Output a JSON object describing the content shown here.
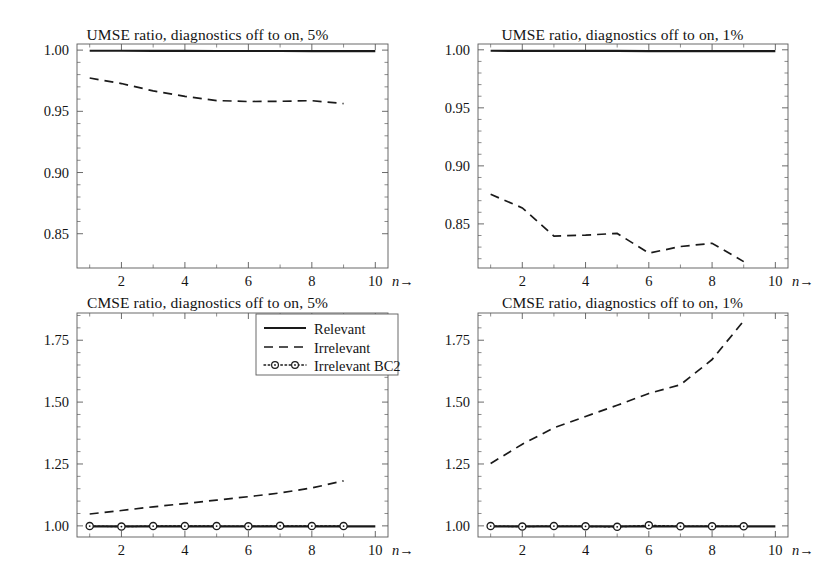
{
  "figure": {
    "background": "#ffffff",
    "axis_color": "#5a5a5a",
    "line_color": "#1a1a1a",
    "panel_count": 4
  },
  "legend": {
    "position": "bottom-left-panel-top-right",
    "entries": [
      {
        "label": "Relevant",
        "style": "solid"
      },
      {
        "label": "Irrelevant",
        "style": "dashed"
      },
      {
        "label": "Irrelevant BC2",
        "style": "dotted-circles"
      }
    ]
  },
  "axis": {
    "x_arrow_label_prefix": "10",
    "x_arrow_label_var": "n",
    "x_arrow_glyph": "→"
  },
  "chart_data": [
    {
      "id": "umse-5pct",
      "type": "line",
      "title": "UMSE ratio, diagnostics off to on, 5%",
      "xlabel": "n",
      "ylabel": "",
      "xlim": [
        0.6,
        10.4
      ],
      "ylim": [
        0.822,
        1.005
      ],
      "xticks": [
        2,
        4,
        6,
        8,
        10
      ],
      "xticklabels": [
        "2",
        "4",
        "6",
        "8",
        "10"
      ],
      "xminorticks": [
        1,
        3,
        5,
        7,
        9
      ],
      "yticks": [
        0.85,
        0.9,
        0.95,
        1.0
      ],
      "yticklabels": [
        "0.85",
        "0.90",
        "0.95",
        "1.00"
      ],
      "yminorticks": [
        0.86,
        0.87,
        0.88,
        0.89,
        0.91,
        0.92,
        0.93,
        0.94,
        0.96,
        0.97,
        0.98,
        0.99
      ],
      "grid": false,
      "x": [
        1,
        2,
        3,
        4,
        5,
        6,
        7,
        8,
        9,
        10
      ],
      "series": [
        {
          "name": "Relevant",
          "style": "solid",
          "x": [
            1,
            2,
            3,
            4,
            5,
            6,
            7,
            8,
            9,
            10
          ],
          "values": [
            0.9995,
            0.9995,
            0.9994,
            0.9994,
            0.9993,
            0.9993,
            0.9993,
            0.9992,
            0.9992,
            0.9992
          ]
        },
        {
          "name": "Irrelevant",
          "style": "dashed",
          "x": [
            1,
            2,
            3,
            4,
            5,
            6,
            7,
            8,
            9
          ],
          "values": [
            0.9772,
            0.9727,
            0.9667,
            0.9622,
            0.9588,
            0.958,
            0.9582,
            0.9587,
            0.9563
          ]
        }
      ]
    },
    {
      "id": "umse-1pct",
      "type": "line",
      "title": "UMSE ratio, diagnostics off to on, 1%",
      "xlabel": "n",
      "ylabel": "",
      "xlim": [
        0.6,
        10.4
      ],
      "ylim": [
        0.812,
        1.005
      ],
      "xticks": [
        2,
        4,
        6,
        8,
        10
      ],
      "xticklabels": [
        "2",
        "4",
        "6",
        "8",
        "10"
      ],
      "xminorticks": [
        1,
        3,
        5,
        7,
        9
      ],
      "yticks": [
        0.85,
        0.9,
        0.95,
        1.0
      ],
      "yticklabels": [
        "0.85",
        "0.90",
        "0.95",
        "1.00"
      ],
      "yminorticks": [
        0.82,
        0.83,
        0.84,
        0.86,
        0.87,
        0.88,
        0.89,
        0.91,
        0.92,
        0.93,
        0.94,
        0.96,
        0.97,
        0.98,
        0.99
      ],
      "grid": false,
      "x": [
        1,
        2,
        3,
        4,
        5,
        6,
        7,
        8,
        9,
        10
      ],
      "series": [
        {
          "name": "Relevant",
          "style": "solid",
          "x": [
            1,
            2,
            3,
            4,
            5,
            6,
            7,
            8,
            9,
            10
          ],
          "values": [
            0.9992,
            0.9991,
            0.9991,
            0.999,
            0.999,
            0.9989,
            0.9989,
            0.9989,
            0.9988,
            0.9988
          ]
        },
        {
          "name": "Irrelevant",
          "style": "dashed",
          "x": [
            1,
            2,
            3,
            4,
            5,
            6,
            7,
            8,
            9
          ],
          "values": [
            0.8755,
            0.8638,
            0.8395,
            0.8403,
            0.8418,
            0.8248,
            0.8305,
            0.8333,
            0.8175
          ]
        }
      ]
    },
    {
      "id": "cmse-5pct",
      "type": "line",
      "title": "CMSE ratio, diagnostics off to on, 5%",
      "xlabel": "n",
      "ylabel": "",
      "xlim": [
        0.6,
        10.4
      ],
      "ylim": [
        0.955,
        1.86
      ],
      "xticks": [
        2,
        4,
        6,
        8,
        10
      ],
      "xticklabels": [
        "2",
        "4",
        "6",
        "8",
        "10"
      ],
      "xminorticks": [
        1,
        3,
        5,
        7,
        9
      ],
      "yticks": [
        1.0,
        1.25,
        1.5,
        1.75
      ],
      "yticklabels": [
        "1.00",
        "1.25",
        "1.50",
        "1.75"
      ],
      "yminorticks": [
        1.05,
        1.1,
        1.15,
        1.2,
        1.3,
        1.35,
        1.4,
        1.45,
        1.55,
        1.6,
        1.65,
        1.7,
        1.8,
        1.85
      ],
      "grid": false,
      "has_legend": true,
      "x": [
        1,
        2,
        3,
        4,
        5,
        6,
        7,
        8,
        9,
        10
      ],
      "series": [
        {
          "name": "Relevant",
          "style": "solid",
          "x": [
            1,
            2,
            3,
            4,
            5,
            6,
            7,
            8,
            9,
            10
          ],
          "values": [
            0.998,
            0.998,
            0.998,
            0.998,
            0.998,
            0.998,
            0.998,
            0.998,
            0.998,
            0.998
          ]
        },
        {
          "name": "Irrelevant",
          "style": "dashed",
          "x": [
            1,
            2,
            3,
            4,
            5,
            6,
            7,
            8,
            9
          ],
          "values": [
            1.048,
            1.062,
            1.077,
            1.09,
            1.104,
            1.118,
            1.133,
            1.153,
            1.182
          ]
        },
        {
          "name": "Irrelevant BC2",
          "style": "dotted-circles",
          "x": [
            1,
            2,
            3,
            4,
            5,
            6,
            7,
            8,
            9
          ],
          "values": [
            0.999,
            0.997,
            0.999,
            0.999,
            0.999,
            0.998,
            1.0,
            0.999,
            0.999
          ]
        }
      ]
    },
    {
      "id": "cmse-1pct",
      "type": "line",
      "title": "CMSE ratio, diagnostics off to on, 1%",
      "xlabel": "n",
      "ylabel": "",
      "xlim": [
        0.6,
        10.4
      ],
      "ylim": [
        0.955,
        1.86
      ],
      "xticks": [
        2,
        4,
        6,
        8,
        10
      ],
      "xticklabels": [
        "2",
        "4",
        "6",
        "8",
        "10"
      ],
      "xminorticks": [
        1,
        3,
        5,
        7,
        9
      ],
      "yticks": [
        1.0,
        1.25,
        1.5,
        1.75
      ],
      "yticklabels": [
        "1.00",
        "1.25",
        "1.50",
        "1.75"
      ],
      "yminorticks": [
        1.05,
        1.1,
        1.15,
        1.2,
        1.3,
        1.35,
        1.4,
        1.45,
        1.55,
        1.6,
        1.65,
        1.7,
        1.8,
        1.85
      ],
      "grid": false,
      "has_legend": false,
      "x": [
        1,
        2,
        3,
        4,
        5,
        6,
        7,
        8,
        9,
        10
      ],
      "series": [
        {
          "name": "Relevant",
          "style": "solid",
          "x": [
            1,
            2,
            3,
            4,
            5,
            6,
            7,
            8,
            9,
            10
          ],
          "values": [
            0.998,
            0.998,
            0.998,
            0.998,
            0.998,
            0.998,
            0.998,
            0.998,
            0.998,
            0.998
          ]
        },
        {
          "name": "Irrelevant",
          "style": "dashed",
          "x": [
            1,
            2,
            3,
            4,
            5,
            6,
            7,
            8,
            9
          ],
          "values": [
            1.252,
            1.33,
            1.396,
            1.442,
            1.487,
            1.535,
            1.57,
            1.672,
            1.828
          ]
        },
        {
          "name": "Irrelevant BC2",
          "style": "dotted-circles",
          "x": [
            1,
            2,
            3,
            4,
            5,
            6,
            7,
            8,
            9
          ],
          "values": [
            0.999,
            0.997,
            0.999,
            0.998,
            0.996,
            1.002,
            0.998,
            0.998,
            0.998
          ]
        }
      ]
    }
  ]
}
